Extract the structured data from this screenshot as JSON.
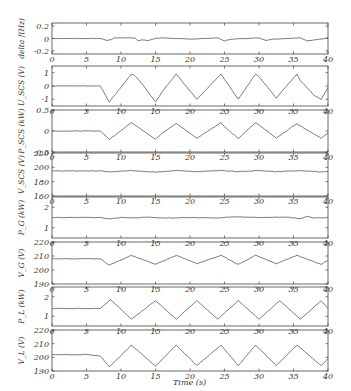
{
  "chart_data": {
    "type": "line",
    "title": "",
    "xlabel": "Time (s)",
    "xlim": [
      0,
      40
    ],
    "xticks": [
      0,
      5,
      10,
      15,
      20,
      25,
      30,
      35,
      40
    ],
    "grid": false,
    "legend": null,
    "line_color": "#555555",
    "panels": [
      {
        "id": "delta_f",
        "ylabel": "delta f(Hz)",
        "ylim": [
          -0.25,
          0.25
        ],
        "yticks": [
          -0.2,
          0,
          0.2
        ],
        "ytick_labels": [
          "-0.2",
          "0",
          "0.2"
        ],
        "x": [
          0,
          7,
          8,
          8.5,
          9,
          12,
          12.5,
          13,
          14,
          15,
          16,
          20,
          24,
          25,
          26,
          30,
          31,
          32,
          36,
          37,
          38,
          39,
          40
        ],
        "values": [
          0,
          0,
          -0.03,
          -0.02,
          0.01,
          0.01,
          -0.04,
          -0.02,
          -0.03,
          0,
          0.01,
          -0.01,
          0.01,
          -0.04,
          -0.01,
          0.01,
          -0.03,
          -0.01,
          0.01,
          -0.04,
          -0.02,
          -0.01,
          0.01
        ]
      },
      {
        "id": "U_SCS",
        "ylabel": "U_SCS (V)",
        "ylim": [
          -1.5,
          1.5
        ],
        "yticks": [
          -1,
          0,
          1
        ],
        "ytick_labels": [
          "-1",
          "0",
          "1"
        ],
        "x": [
          0,
          7,
          8.3,
          11.5,
          12,
          13,
          15,
          16,
          18,
          21,
          24.5,
          25,
          27,
          29.5,
          30,
          32.5,
          35.5,
          36,
          38,
          39,
          40
        ],
        "values": [
          0,
          0,
          -1.2,
          0.9,
          0.8,
          0.2,
          -1.2,
          -0.4,
          0.9,
          -1.0,
          0.9,
          0.5,
          -1.0,
          0.9,
          0.7,
          -0.9,
          0.9,
          0.4,
          -0.7,
          -1.0,
          -0.1
        ]
      },
      {
        "id": "P_SCS",
        "ylabel": "P_SCS (kW)",
        "ylim": [
          -0.5,
          0.5
        ],
        "yticks": [
          -0.5,
          0,
          0.5
        ],
        "ytick_labels": [
          "-0.5",
          "0",
          "0.5"
        ],
        "x": [
          0,
          7,
          8.3,
          11.5,
          12,
          15,
          16,
          18,
          21,
          24.5,
          25,
          27,
          29.5,
          30,
          32.5,
          35.5,
          36,
          39,
          40
        ],
        "values": [
          0,
          0,
          -0.2,
          0.2,
          0.15,
          -0.2,
          -0.05,
          0.18,
          -0.17,
          0.2,
          0.1,
          -0.18,
          0.2,
          0.15,
          -0.17,
          0.18,
          0.12,
          -0.17,
          -0.05
        ]
      },
      {
        "id": "V_SCS",
        "ylabel": "V_SCS (V)",
        "ylim": [
          160,
          220
        ],
        "yticks": [
          160,
          180,
          200,
          220
        ],
        "ytick_labels": [
          "160",
          "180",
          "200",
          "220"
        ],
        "x": [
          0,
          7,
          8.5,
          11.5,
          15,
          18,
          21,
          24.5,
          27,
          30,
          32.5,
          36,
          39,
          40
        ],
        "values": [
          195,
          195,
          193.5,
          195.5,
          193.5,
          195.5,
          194,
          195.5,
          194,
          195.5,
          194,
          195.5,
          193.5,
          194.5
        ]
      },
      {
        "id": "P_G",
        "ylabel": "P_G (kW)",
        "ylim": [
          0.5,
          2.5
        ],
        "yticks": [
          1,
          2
        ],
        "ytick_labels": [
          "1",
          "2"
        ],
        "x": [
          0,
          7,
          8.5,
          10,
          12,
          14,
          16,
          20,
          24,
          26,
          30,
          34,
          36,
          37,
          38,
          40
        ],
        "values": [
          1.5,
          1.5,
          1.43,
          1.5,
          1.48,
          1.52,
          1.47,
          1.5,
          1.48,
          1.53,
          1.5,
          1.52,
          1.44,
          1.56,
          1.47,
          1.5
        ]
      },
      {
        "id": "V_G",
        "ylabel": "V_G (V)",
        "ylim": [
          190,
          220
        ],
        "yticks": [
          190,
          200,
          210,
          220
        ],
        "ytick_labels": [
          "190",
          "200",
          "210",
          "220"
        ],
        "x": [
          0,
          7,
          8.3,
          11.5,
          15,
          18,
          21,
          24.5,
          27,
          29.5,
          32.5,
          35.5,
          39,
          40
        ],
        "values": [
          208,
          208,
          203.5,
          210.5,
          204,
          210.5,
          204.5,
          210.5,
          204,
          210.5,
          204.5,
          210.5,
          204,
          207
        ]
      },
      {
        "id": "P_L",
        "ylabel": "P_L (kW)",
        "ylim": [
          0.5,
          2.5
        ],
        "yticks": [
          1,
          2
        ],
        "ytick_labels": [
          "1",
          "2"
        ],
        "x": [
          0,
          7,
          8.5,
          11.5,
          15,
          18,
          21,
          24,
          27,
          30,
          33,
          36,
          39,
          40
        ],
        "values": [
          1.4,
          1.4,
          1.85,
          0.85,
          1.8,
          0.85,
          1.8,
          0.85,
          1.8,
          0.85,
          1.8,
          0.85,
          1.8,
          1.4
        ]
      },
      {
        "id": "V_L",
        "ylabel": "V_L (V)",
        "ylim": [
          190,
          220
        ],
        "yticks": [
          190,
          200,
          210,
          220
        ],
        "ytick_labels": [
          "190",
          "200",
          "210",
          "220"
        ],
        "x": [
          0,
          5,
          7,
          8.3,
          11.5,
          15,
          18,
          21,
          24.5,
          27,
          29.5,
          32.5,
          35.5,
          39,
          40
        ],
        "values": [
          202,
          202,
          201,
          193,
          209,
          193.5,
          209,
          194,
          209,
          194,
          209,
          194,
          209,
          194,
          199
        ]
      }
    ]
  }
}
